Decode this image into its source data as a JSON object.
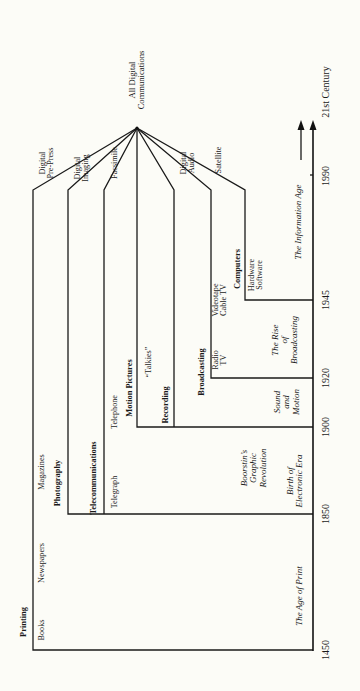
{
  "diagram": {
    "title_node": "All Digital\nCommunications",
    "streams": [
      {
        "name": "Printing",
        "items": [
          "Books",
          "Newspapers",
          "Magazines",
          "Digital\nPre-Press"
        ]
      },
      {
        "name": "Photography",
        "items": [
          "Digital\nImaging"
        ]
      },
      {
        "name": "Telecommunications",
        "items": [
          "Telegraph",
          "Telephone",
          "Facsimile"
        ]
      },
      {
        "name": "Motion Pictures",
        "items": [
          "“Talkies”"
        ]
      },
      {
        "name": "Recording",
        "items": [
          "Digital\nAudio"
        ]
      },
      {
        "name": "Broadcasting",
        "items": [
          "Radio\nTV",
          "Videotape\nCable TV",
          "Satellite"
        ]
      },
      {
        "name": "Computers",
        "items": [
          "Hardware\nSoftware"
        ]
      }
    ],
    "eras": [
      {
        "label": "The Age of Print"
      },
      {
        "label": "Boorstin’s\nGraphic\nRevolution"
      },
      {
        "label": "Birth of\nElectronic Era"
      },
      {
        "label": "Sound\nand\nMotion"
      },
      {
        "label": "The Rise\nof\nBroadcasting"
      },
      {
        "label": "The Information Age"
      }
    ],
    "timeline": {
      "years": [
        "1450",
        "1850",
        "1900",
        "1920",
        "1945",
        "1990",
        "21st Century"
      ]
    }
  }
}
